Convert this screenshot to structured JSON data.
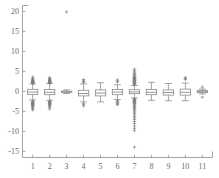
{
  "chart_data": {
    "type": "box",
    "title": "",
    "xlabel": "",
    "ylabel": "",
    "xlim": [
      0.4,
      11.6
    ],
    "ylim": [
      -16.5,
      21.5
    ],
    "grid": false,
    "legend": null,
    "axis_color": "#9a9a9a",
    "box_color": "#8a8a8a",
    "outlier_color": "#7d7d7d",
    "outlier_marker": "+",
    "background": "#ffffff",
    "yticks": [
      20,
      15,
      10,
      5,
      0,
      -5,
      -10,
      -15
    ],
    "ytick_labels": [
      "20",
      "15",
      "10",
      "5",
      "0",
      "-5",
      "-10",
      "-15"
    ],
    "xticks": [
      1,
      2,
      3,
      4,
      5,
      6,
      7,
      8,
      9,
      10,
      11
    ],
    "xtick_labels": [
      "1",
      "2",
      "3",
      "4",
      "5",
      "6",
      "7",
      "8",
      "9",
      "10",
      "11"
    ],
    "categories": [
      "1",
      "2",
      "3",
      "4",
      "5",
      "6",
      "7",
      "8",
      "9",
      "10",
      "11"
    ],
    "boxes": [
      {
        "label": "1",
        "x": 1,
        "q1": -0.75,
        "median": -0.15,
        "q3": 0.55,
        "whisker_low": -2.1,
        "whisker_high": 1.9,
        "outliers": [
          3.6,
          3.3,
          3.1,
          2.9,
          2.8,
          2.7,
          2.6,
          2.5,
          2.45,
          2.4,
          2.35,
          2.3,
          2.25,
          2.2,
          2.15,
          2.1,
          2.05,
          -2.4,
          -2.5,
          -2.6,
          -2.7,
          -2.8,
          -2.9,
          -3.0,
          -3.1,
          -3.2,
          -3.3,
          -3.4,
          -3.5,
          -3.6,
          -3.8,
          -4.0,
          -4.3,
          -4.6
        ]
      },
      {
        "label": "2",
        "x": 2,
        "q1": -0.8,
        "median": -0.2,
        "q3": 0.5,
        "whisker_low": -2.2,
        "whisker_high": 2.0,
        "outliers": [
          3.5,
          3.2,
          3.0,
          2.9,
          2.8,
          2.7,
          2.6,
          2.5,
          2.45,
          2.4,
          2.35,
          2.3,
          2.25,
          2.2,
          2.15,
          2.1,
          -2.4,
          -2.5,
          -2.6,
          -2.7,
          -2.8,
          -2.9,
          -3.0,
          -3.1,
          -3.2,
          -3.3,
          -3.5,
          -3.7,
          -4.0,
          -4.4
        ]
      },
      {
        "label": "3",
        "x": 3,
        "q1": -0.2,
        "median": -0.1,
        "q3": 0.1,
        "whisker_low": -0.5,
        "whisker_high": 0.4,
        "outliers": [
          19.9
        ]
      },
      {
        "label": "4",
        "x": 4,
        "q1": -1.1,
        "median": -0.5,
        "q3": 0.3,
        "whisker_low": -2.6,
        "whisker_high": 1.9,
        "outliers": [
          3.0,
          2.7,
          2.5,
          2.3,
          -3.0,
          -3.3,
          -3.6
        ]
      },
      {
        "label": "5",
        "x": 5,
        "q1": -1.1,
        "median": -0.4,
        "q3": 0.4,
        "whisker_low": -2.6,
        "whisker_high": 2.2,
        "outliers": []
      },
      {
        "label": "6",
        "x": 6,
        "q1": -0.8,
        "median": -0.15,
        "q3": 0.5,
        "whisker_low": -2.0,
        "whisker_high": 1.7,
        "outliers": [
          2.9,
          2.6,
          2.4,
          -2.3,
          -2.5,
          -2.7,
          -2.9,
          -3.1,
          -3.3
        ]
      },
      {
        "label": "7",
        "x": 7,
        "q1": -0.55,
        "median": -0.1,
        "q3": 0.45,
        "whisker_low": -1.6,
        "whisker_high": 1.5,
        "outliers": [
          5.6,
          5.2,
          4.9,
          4.6,
          4.4,
          4.2,
          4.0,
          3.8,
          3.6,
          3.5,
          3.4,
          3.3,
          3.2,
          3.1,
          3.0,
          2.9,
          2.8,
          2.7,
          2.6,
          2.5,
          2.4,
          2.3,
          2.2,
          2.1,
          2.0,
          1.9,
          1.8,
          1.7,
          -1.8,
          -1.9,
          -2.0,
          -2.1,
          -2.2,
          -2.3,
          -2.4,
          -2.5,
          -2.6,
          -2.7,
          -2.8,
          -2.9,
          -3.0,
          -3.2,
          -3.4,
          -3.6,
          -3.8,
          -4.0,
          -4.2,
          -4.5,
          -4.8,
          -5.1,
          -5.4,
          -5.8,
          -6.2,
          -6.6,
          -7.0,
          -7.5,
          -8.0,
          -8.6,
          -9.2,
          -9.8,
          -13.9
        ]
      },
      {
        "label": "8",
        "x": 8,
        "q1": -0.8,
        "median": -0.2,
        "q3": 0.5,
        "whisker_low": -2.2,
        "whisker_high": 2.3,
        "outliers": []
      },
      {
        "label": "9",
        "x": 9,
        "q1": -0.9,
        "median": -0.25,
        "q3": 0.4,
        "whisker_low": -2.3,
        "whisker_high": 2.0,
        "outliers": []
      },
      {
        "label": "10",
        "x": 10,
        "q1": -0.9,
        "median": -0.2,
        "q3": 0.6,
        "whisker_low": -2.3,
        "whisker_high": 2.1,
        "outliers": [
          3.5,
          3.2,
          3.0
        ]
      },
      {
        "label": "11",
        "x": 11,
        "q1": -0.3,
        "median": -0.05,
        "q3": 0.25,
        "whisker_low": -0.6,
        "whisker_high": 0.6,
        "outliers": [
          1.1,
          -1.4
        ]
      }
    ]
  }
}
